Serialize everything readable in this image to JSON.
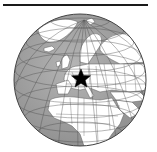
{
  "map": {
    "type": "orthographic-globe",
    "region_shown": "Europe and Africa",
    "marker": {
      "shape": "star",
      "location": "Central Europe"
    },
    "colors": {
      "ocean": "#a3a3a3",
      "land": "#ffffff",
      "borders": "#555555",
      "graticule": "#4a4a4a",
      "marker": "#000000",
      "header_bar": "#1a1a1a"
    }
  }
}
